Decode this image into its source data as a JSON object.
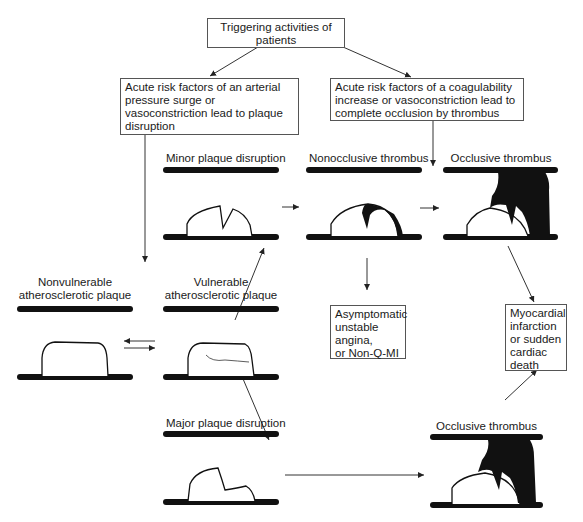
{
  "title_box": {
    "text": "Triggering activities of patients",
    "line1": "Triggering activities of",
    "line2": "patients"
  },
  "left_risk_box": {
    "text": "Acute risk factors of an arterial pressure surge or vasoconstriction lead to plaque disruption"
  },
  "right_risk_box": {
    "text": "Acute risk factors of a coagulability increase or vasoconstriction lead to complete occlusion by thrombus"
  },
  "stages": {
    "nonvulnerable": {
      "line1": "Nonvulnerable",
      "line2": "atherosclerotic plaque"
    },
    "vulnerable": {
      "line1": "Vulnerable",
      "line2": "atherosclerotic plaque"
    },
    "minor_disruption": "Minor plaque disruption",
    "major_disruption": "Major plaque disruption",
    "nonocclusive_thrombus": "Nonocclusive thrombus",
    "occlusive_thrombus_top": "Occlusive thrombus",
    "occlusive_thrombus_bottom": "Occlusive thrombus"
  },
  "outcomes": {
    "asymptomatic": {
      "lines": [
        "Asymptomatic",
        "unstable",
        "angina,",
        "or Non-Q-MI"
      ]
    },
    "mi": {
      "lines": [
        "Myocardial",
        "infarction",
        "or sudden",
        "cardiac",
        "death"
      ]
    }
  },
  "colors": {
    "ink": "#1a1a1a",
    "box_border": "#555555",
    "background": "#ffffff"
  }
}
